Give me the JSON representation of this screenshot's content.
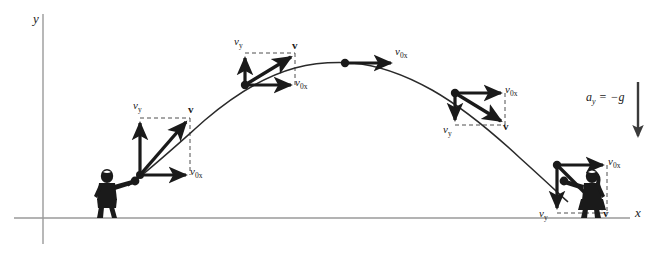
{
  "figure": {
    "background_color": "#ffffff",
    "ink_color": "#1a1a1a",
    "width": 663,
    "height": 259
  },
  "axes": {
    "y_label": "y",
    "x_label": "x",
    "y_axis": {
      "x": 43,
      "y_top": 14,
      "y_bottom": 244
    },
    "x_axis": {
      "y": 218,
      "x_left": 14,
      "x_right": 630
    }
  },
  "acceleration": {
    "label_symbol": "a",
    "label_subscript": "y",
    "label_equals": "=",
    "label_value": "−g",
    "full_text": "a_y = -g",
    "arrow": {
      "x": 638,
      "y_start": 82,
      "y_end": 142,
      "direction": "down"
    }
  },
  "trajectory": {
    "type": "parabola",
    "launch_point": {
      "x": 140,
      "y": 175
    },
    "apex_point": {
      "x": 345,
      "y": 63
    },
    "landing_point": {
      "x": 557,
      "y": 165
    },
    "path_d": "M 128 185 Q 150 170 175 146 Q 210 113 245 85 Q 290 60 345 63 Q 400 68 455 93 Q 510 124 570 178"
  },
  "points": [
    {
      "name": "launch",
      "index": 0,
      "position": {
        "x": 140,
        "y": 175
      },
      "vy_label": "v",
      "vy_sub": "y",
      "vy_direction": "up",
      "vy_magnitude": 55,
      "vx_label": "v",
      "vx_sub": "0x",
      "vx_direction": "right",
      "vx_magnitude": 50,
      "v_label": "v",
      "v_angle_deg": 48
    },
    {
      "name": "rising",
      "index": 1,
      "position": {
        "x": 245,
        "y": 85
      },
      "vy_label": "v",
      "vy_sub": "y",
      "vy_direction": "up",
      "vy_magnitude": 32,
      "vx_label": "v",
      "vx_sub": "0x",
      "vx_direction": "right",
      "vx_magnitude": 50,
      "v_label": "v",
      "v_angle_deg": 33
    },
    {
      "name": "apex",
      "index": 2,
      "position": {
        "x": 345,
        "y": 63
      },
      "vy_label": null,
      "vy_sub": null,
      "vy_direction": "none",
      "vy_magnitude": 0,
      "vx_label": "v",
      "vx_sub": "0x",
      "vx_direction": "right",
      "vx_magnitude": 50,
      "v_label": null,
      "v_angle_deg": 0
    },
    {
      "name": "falling",
      "index": 3,
      "position": {
        "x": 455,
        "y": 93
      },
      "vy_label": "v",
      "vy_sub": "y",
      "vy_direction": "down",
      "vy_magnitude": 32,
      "vx_label": "v",
      "vx_sub": "0x",
      "vx_direction": "right",
      "vx_magnitude": 50,
      "v_label": "v",
      "v_angle_deg": -33
    },
    {
      "name": "landing",
      "index": 4,
      "position": {
        "x": 557,
        "y": 165
      },
      "vy_label": "v",
      "vy_sub": "y",
      "vy_direction": "down",
      "vy_magnitude": 53,
      "vx_label": "v",
      "vx_sub": "0x",
      "vx_direction": "right",
      "vx_magnitude": 50,
      "v_label": "v",
      "v_angle_deg": -47
    }
  ],
  "figures": [
    {
      "name": "thrower",
      "role": "person throwing the ball",
      "x": 112,
      "y": 196
    },
    {
      "name": "catcher",
      "role": "person catching the ball",
      "x": 594,
      "y": 196
    }
  ],
  "labels": {
    "vy_launch": "v",
    "v0x_launch": "v",
    "v_launch": "v",
    "vy_rising": "v",
    "v0x_rising": "v",
    "v_rising": "v",
    "v0x_apex": "v",
    "vy_falling": "v",
    "v0x_falling": "v",
    "v_falling": "v",
    "vy_landing": "v",
    "v0x_landing": "v",
    "v_landing": "v",
    "sub_y": "y",
    "sub_0x": "0x"
  }
}
